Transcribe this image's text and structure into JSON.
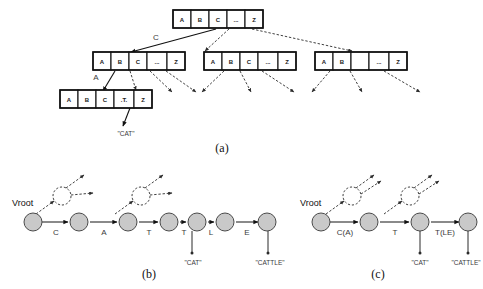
{
  "figure": {
    "caption_a": "(a)",
    "caption_b": "(b)",
    "caption_c": "(c)"
  },
  "panel_a": {
    "root_node": {
      "cells": [
        "A",
        "B",
        "C",
        "...",
        "Z"
      ]
    },
    "level2_left": {
      "cells": [
        "A",
        "B",
        "C",
        "...",
        "Z"
      ]
    },
    "level2_middle": {
      "cells": [
        "A",
        "B",
        "C",
        "...",
        "Z"
      ]
    },
    "level2_right": {
      "cells": [
        "A",
        "B",
        "",
        "...",
        "Z"
      ]
    },
    "level3_left": {
      "cells": [
        "A",
        "B",
        "C",
        ".T.",
        "Z"
      ]
    },
    "edge_label_c": "C",
    "edge_label_a": "A",
    "word_cat": "\"CAT\""
  },
  "panel_b": {
    "root_label": "Vroot",
    "edge_labels": [
      "C",
      "A",
      "T",
      "T",
      "L",
      "E"
    ],
    "word_labels": [
      "\"CAT\"",
      "\"CATTLE\""
    ]
  },
  "panel_c": {
    "root_label": "Vroot",
    "edge_labels": [
      "C(A)",
      "T",
      "T(LE)"
    ],
    "word_labels": [
      "\"CAT\"",
      "\"CATTLE\""
    ]
  },
  "colors": {
    "node_fill": "#c9c9c9",
    "node_stroke": "#4a4a4a",
    "line": "#111111",
    "background": "#ffffff"
  }
}
